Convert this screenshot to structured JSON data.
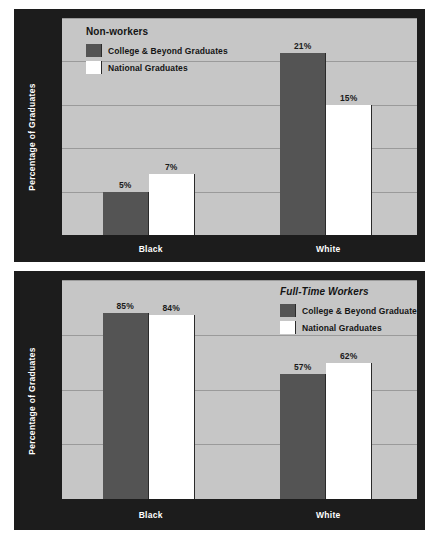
{
  "chart_data": [
    {
      "id": "nonworkers",
      "type": "bar",
      "title": "Non-workers",
      "xlabel": "",
      "ylabel": "Percentage of Graduates",
      "categories": [
        "Black",
        "White"
      ],
      "ylim": [
        0,
        25
      ],
      "yticks": [
        "0",
        "5",
        "10",
        "15",
        "20",
        "25"
      ],
      "ytick_values": [
        0,
        5,
        10,
        15,
        20,
        25
      ],
      "grid": true,
      "legend_position": "top-left",
      "series": [
        {
          "name": "College & Beyond Graduates",
          "color": "#545454",
          "values": [
            5,
            21
          ],
          "labels": [
            "5%",
            "21%"
          ]
        },
        {
          "name": "National Graduates",
          "color": "#ffffff",
          "values": [
            7,
            15
          ],
          "labels": [
            "7%",
            "15%"
          ]
        }
      ]
    },
    {
      "id": "fulltime",
      "type": "bar",
      "title": "Full-Time Workers",
      "xlabel": "",
      "ylabel": "Percentage of Graduates",
      "categories": [
        "Black",
        "White"
      ],
      "ylim": [
        0,
        100
      ],
      "yticks": [
        "0",
        "25",
        "50",
        "75",
        "100"
      ],
      "ytick_values": [
        0,
        25,
        50,
        75,
        100
      ],
      "grid": true,
      "legend_position": "top-right",
      "series": [
        {
          "name": "College & Beyond Graduates",
          "color": "#545454",
          "values": [
            85,
            57
          ],
          "labels": [
            "85%",
            "57%"
          ]
        },
        {
          "name": "National Graduates",
          "color": "#ffffff",
          "values": [
            84,
            62
          ],
          "labels": [
            "84%",
            "62%"
          ]
        }
      ]
    }
  ],
  "colors": {
    "panel_background": "#1c1c1c",
    "plot_background": "#c6c6c6",
    "gridline": "#9a9a9a",
    "series_dark": "#545454",
    "series_light": "#ffffff",
    "axis_text": "#ffffff",
    "label_text": "#1a1a1a"
  }
}
